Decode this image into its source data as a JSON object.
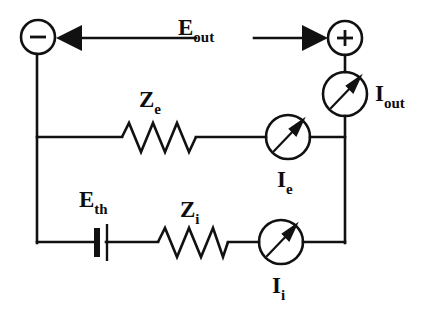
{
  "diagram": {
    "type": "electrical-schematic",
    "stroke_color": "#111111",
    "background_color": "#ffffff",
    "terminals": [
      {
        "id": "negative",
        "symbol": "−",
        "name": "negative-terminal",
        "cx": 38,
        "cy": 37,
        "r": 17
      },
      {
        "id": "positive",
        "symbol": "+",
        "name": "positive-terminal",
        "cx": 345,
        "cy": 38,
        "r": 17
      }
    ],
    "labels": {
      "e_out": {
        "base": "E",
        "sub": "out"
      },
      "i_out": {
        "base": "I",
        "sub": "out"
      },
      "z_e": {
        "base": "Z",
        "sub": "e"
      },
      "i_e": {
        "base": "I",
        "sub": "e"
      },
      "e_th": {
        "base": "E",
        "sub": "th"
      },
      "z_i": {
        "base": "Z",
        "sub": "i"
      },
      "i_i": {
        "base": "I",
        "sub": "i"
      }
    },
    "components": [
      {
        "name": "resistor-ze",
        "kind": "resistor",
        "label": "Z_e",
        "branch": "external"
      },
      {
        "name": "resistor-zi",
        "kind": "resistor",
        "label": "Z_i",
        "branch": "internal"
      },
      {
        "name": "battery-eth",
        "kind": "battery",
        "label": "E_th",
        "branch": "internal"
      },
      {
        "name": "meter-iout",
        "kind": "ammeter",
        "label": "I_out",
        "branch": "output"
      },
      {
        "name": "meter-ie",
        "kind": "ammeter",
        "label": "I_e",
        "branch": "external"
      },
      {
        "name": "meter-ii",
        "kind": "ammeter",
        "label": "I_i",
        "branch": "internal"
      }
    ],
    "arrows": [
      {
        "name": "eout-arrow-left",
        "direction": "left",
        "points_to": "negative-terminal"
      },
      {
        "name": "eout-arrow-right",
        "direction": "right",
        "points_to": "positive-terminal"
      }
    ]
  }
}
